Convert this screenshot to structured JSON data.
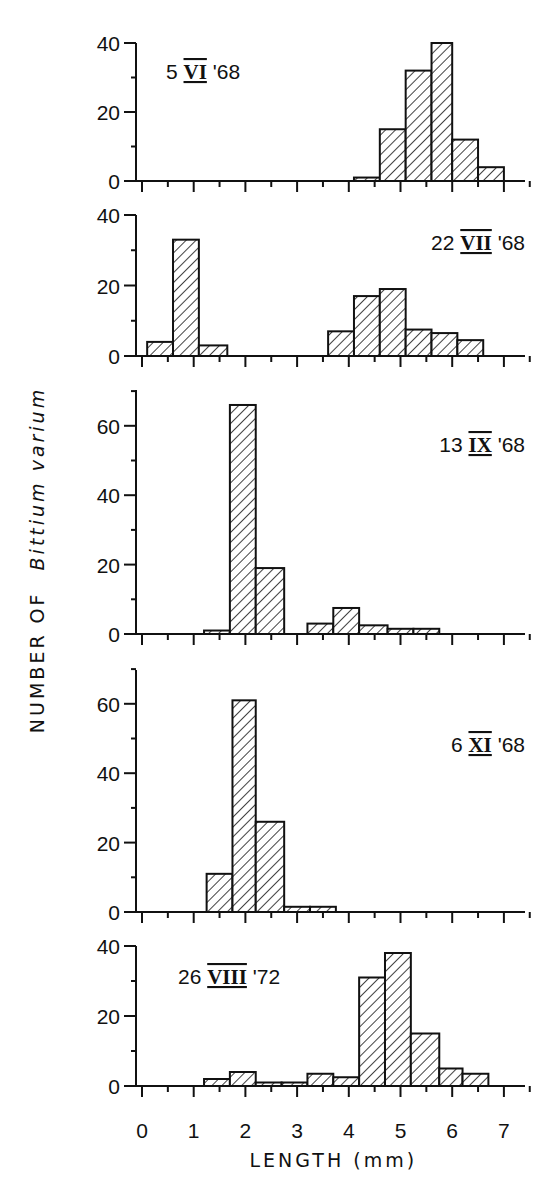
{
  "chart_data": {
    "type": "bar",
    "subtype": "stacked-panel histograms",
    "ylabel": "NUMBER OF Bittium varium",
    "ylabel_plain": "NUMBER OF",
    "ylabel_italic": "Bittium varium",
    "xlabel": "LENGTH (mm)",
    "x_ticks": [
      "0",
      "1",
      "2",
      "3",
      "4",
      "5",
      "6",
      "7"
    ],
    "xlim": [
      0,
      7.5
    ],
    "bin_width_mm": 0.5,
    "grid": false,
    "fill": "diagonal hatch",
    "panels": [
      {
        "label": "5 VI '68",
        "day": "5",
        "month": "VI",
        "year": "'68",
        "ylim": [
          0,
          40
        ],
        "y_ticks": [
          "0",
          "20",
          "40"
        ],
        "bins": [
          {
            "start": 4.1,
            "end": 4.6,
            "count": 1
          },
          {
            "start": 4.6,
            "end": 5.1,
            "count": 15
          },
          {
            "start": 5.1,
            "end": 5.6,
            "count": 32
          },
          {
            "start": 5.6,
            "end": 6.0,
            "count": 40
          },
          {
            "start": 6.0,
            "end": 6.5,
            "count": 12
          },
          {
            "start": 6.5,
            "end": 7.0,
            "count": 4
          }
        ]
      },
      {
        "label": "22 VII '68",
        "day": "22",
        "month": "VII",
        "year": "'68",
        "ylim": [
          0,
          40
        ],
        "y_ticks": [
          "0",
          "20",
          "40"
        ],
        "bins": [
          {
            "start": 0.1,
            "end": 0.6,
            "count": 4
          },
          {
            "start": 0.6,
            "end": 1.1,
            "count": 33
          },
          {
            "start": 1.1,
            "end": 1.65,
            "count": 3
          },
          {
            "start": 3.6,
            "end": 4.1,
            "count": 7
          },
          {
            "start": 4.1,
            "end": 4.6,
            "count": 17
          },
          {
            "start": 4.6,
            "end": 5.1,
            "count": 19
          },
          {
            "start": 5.1,
            "end": 5.6,
            "count": 7.5
          },
          {
            "start": 5.6,
            "end": 6.1,
            "count": 6.5
          },
          {
            "start": 6.1,
            "end": 6.6,
            "count": 4.5
          }
        ]
      },
      {
        "label": "13 IX '68",
        "day": "13",
        "month": "IX",
        "year": "'68",
        "ylim": [
          0,
          70
        ],
        "y_ticks": [
          "0",
          "20",
          "40",
          "60"
        ],
        "bins": [
          {
            "start": 1.2,
            "end": 1.7,
            "count": 1
          },
          {
            "start": 1.7,
            "end": 2.2,
            "count": 66
          },
          {
            "start": 2.2,
            "end": 2.75,
            "count": 19
          },
          {
            "start": 3.2,
            "end": 3.7,
            "count": 3
          },
          {
            "start": 3.7,
            "end": 4.2,
            "count": 7.5
          },
          {
            "start": 4.2,
            "end": 4.75,
            "count": 2.5
          },
          {
            "start": 4.75,
            "end": 5.25,
            "count": 1.5
          },
          {
            "start": 5.25,
            "end": 5.75,
            "count": 1.5
          }
        ]
      },
      {
        "label": "6 XI '68",
        "day": "6",
        "month": "XI",
        "year": "'68",
        "ylim": [
          0,
          70
        ],
        "y_ticks": [
          "0",
          "20",
          "40",
          "60"
        ],
        "bins": [
          {
            "start": 1.25,
            "end": 1.75,
            "count": 11
          },
          {
            "start": 1.75,
            "end": 2.2,
            "count": 61
          },
          {
            "start": 2.2,
            "end": 2.75,
            "count": 26
          },
          {
            "start": 2.75,
            "end": 3.25,
            "count": 1.5
          },
          {
            "start": 3.25,
            "end": 3.75,
            "count": 1.5
          }
        ]
      },
      {
        "label": "26 VIII '72",
        "day": "26",
        "month": "VIII",
        "year": "'72",
        "ylim": [
          0,
          40
        ],
        "y_ticks": [
          "0",
          "20",
          "40"
        ],
        "bins": [
          {
            "start": 1.2,
            "end": 1.7,
            "count": 2
          },
          {
            "start": 1.7,
            "end": 2.2,
            "count": 4
          },
          {
            "start": 2.2,
            "end": 2.7,
            "count": 1
          },
          {
            "start": 2.7,
            "end": 3.2,
            "count": 1
          },
          {
            "start": 3.2,
            "end": 3.7,
            "count": 3.5
          },
          {
            "start": 3.7,
            "end": 4.2,
            "count": 2.5
          },
          {
            "start": 4.2,
            "end": 4.7,
            "count": 31
          },
          {
            "start": 4.7,
            "end": 5.2,
            "count": 38
          },
          {
            "start": 5.2,
            "end": 5.75,
            "count": 15
          },
          {
            "start": 5.75,
            "end": 6.2,
            "count": 5
          },
          {
            "start": 6.2,
            "end": 6.7,
            "count": 3.5
          }
        ]
      }
    ]
  },
  "layout": {
    "x_origin_px": 142,
    "px_per_mm": 51.7,
    "y_axis_px": 136,
    "x_axis_end_px": 525,
    "panels": [
      {
        "baseline": 181,
        "px_per_unit": 3.45,
        "top": 43,
        "label_x": 166,
        "label_y": 79,
        "anchor": "start"
      },
      {
        "baseline": 356,
        "px_per_unit": 3.525,
        "top": 215,
        "label_x": 525,
        "label_y": 250,
        "anchor": "end"
      },
      {
        "baseline": 634,
        "px_per_unit": 3.47,
        "top": 390,
        "label_x": 525,
        "label_y": 452,
        "anchor": "end"
      },
      {
        "baseline": 912,
        "px_per_unit": 3.47,
        "top": 670,
        "label_x": 525,
        "label_y": 752,
        "anchor": "end"
      },
      {
        "baseline": 1086,
        "px_per_unit": 3.5,
        "top": 946,
        "label_x": 178,
        "label_y": 984,
        "anchor": "start"
      }
    ],
    "xlabel_y": 1167,
    "xticklabel_y": 1138,
    "ylabel_x": 44,
    "ylabel_y": 560
  }
}
